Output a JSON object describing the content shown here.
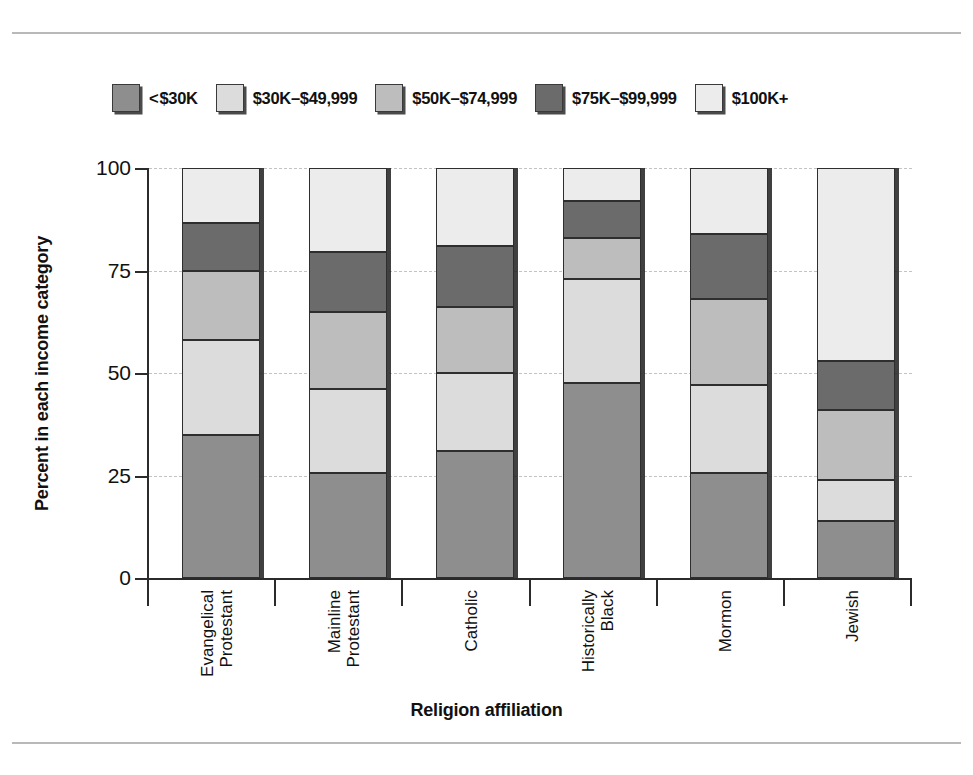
{
  "figure": {
    "has_top_rule": true,
    "has_bottom_rule": true
  },
  "chart_data": {
    "type": "bar",
    "subtype": "stacked-percent",
    "title": "",
    "xlabel": "Religion affiliation",
    "ylabel": "Percent in each income category",
    "ylim": [
      0,
      100
    ],
    "yticks": [
      0,
      25,
      50,
      75,
      100
    ],
    "ytick_labels": [
      "0",
      "25",
      "50",
      "75",
      "100"
    ],
    "grid": "horizontal-dashed",
    "legend_position": "top",
    "categories": [
      "Evangelical\nProtestant",
      "Mainline\nProtestant",
      "Catholic",
      "Historically\nBlack",
      "Mormon",
      "Jewish"
    ],
    "series": [
      {
        "name": "< $30K",
        "color": "#8e8e8e",
        "values": [
          35,
          25.5,
          31,
          47.5,
          25.5,
          14
        ]
      },
      {
        "name": "$30K–$49,999",
        "color": "#dcdcdc",
        "values": [
          23,
          20.5,
          19,
          25.5,
          21.5,
          10
        ]
      },
      {
        "name": "$50K–$74,999",
        "color": "#bdbdbd",
        "values": [
          17,
          19,
          16,
          10,
          21,
          17
        ]
      },
      {
        "name": "$75K–$99,999",
        "color": "#6b6b6b",
        "values": [
          11.5,
          14.5,
          15,
          9,
          16,
          12
        ]
      },
      {
        "name": "$100K+",
        "color": "#ececec",
        "values": [
          13.5,
          20.5,
          19,
          8,
          16,
          47
        ]
      }
    ],
    "cumulative_tops": [
      [
        35,
        58,
        75,
        86.5,
        100
      ],
      [
        25.5,
        46,
        65,
        79.5,
        100
      ],
      [
        31,
        50,
        66,
        81,
        100
      ],
      [
        47.5,
        73,
        83,
        92,
        100
      ],
      [
        25.5,
        47,
        68,
        84,
        100
      ],
      [
        14,
        24,
        41,
        53,
        100
      ]
    ]
  },
  "legend": {
    "items": [
      {
        "label": "< $30K",
        "swatch_color": "#8e8e8e"
      },
      {
        "label": "$30K–$49,999",
        "swatch_color": "#dcdcdc"
      },
      {
        "label": "$50K–$74,999",
        "swatch_color": "#bdbdbd"
      },
      {
        "label": "$75K–$99,999",
        "swatch_color": "#6b6b6b"
      },
      {
        "label": "$100K+",
        "swatch_color": "#ececec"
      }
    ]
  },
  "axes": {
    "y_title": "Percent in each income category",
    "x_title": "Religion affiliation",
    "y_tick_labels": [
      "100",
      "75",
      "50",
      "25",
      "0"
    ],
    "x_tick_labels": [
      "Evangelical\nProtestant",
      "Mainline\nProtestant",
      "Catholic",
      "Historically\nBlack",
      "Mormon",
      "Jewish"
    ]
  }
}
